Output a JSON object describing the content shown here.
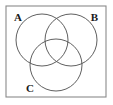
{
  "figure": {
    "type": "venn-diagram",
    "background_color": "#ffffff",
    "universal_set_box": {
      "name": "universal-set-rectangle",
      "stroke_color": "#8a8a8a",
      "fill_color": "#ffffff",
      "stroke_width": 1.1,
      "x": 6,
      "y": 6,
      "width": 100,
      "height": 91
    },
    "circle_stroke_color": "#4d4d4d",
    "circle_stroke_width": 0.9,
    "circles": [
      {
        "set": "A",
        "name": "circle-a",
        "cx": 42,
        "cy": 40,
        "r": 26
      },
      {
        "set": "B",
        "name": "circle-b",
        "cx": 71,
        "cy": 40,
        "r": 26
      },
      {
        "set": "C",
        "name": "circle-c",
        "cx": 56,
        "cy": 65,
        "r": 26
      }
    ],
    "labels": [
      {
        "id": "A",
        "text": "A",
        "name": "label-a",
        "x": 14,
        "y": 21,
        "anchor": "start",
        "color": "#1a1a1a"
      },
      {
        "id": "B",
        "text": "B",
        "name": "label-b",
        "x": 98,
        "y": 21,
        "anchor": "end",
        "color": "#1a1a1a"
      },
      {
        "id": "C",
        "text": "C",
        "name": "label-c",
        "x": 26,
        "y": 92,
        "anchor": "start",
        "color": "#1a1a1a"
      }
    ]
  }
}
